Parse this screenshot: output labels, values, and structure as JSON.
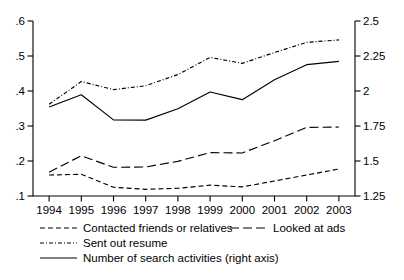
{
  "chart_data": {
    "type": "line",
    "title": "",
    "subtitle": "",
    "xlabel": "",
    "ylabel": "",
    "y2label": "",
    "grid": false,
    "legend_position": "bottom",
    "x": [
      1994,
      1995,
      1996,
      1997,
      1998,
      1999,
      2000,
      2001,
      2002,
      2003
    ],
    "xtick_labels": [
      "1994",
      "1995",
      "1996",
      "1997",
      "1998",
      "1999",
      "2000",
      "2001",
      "2002",
      "2003"
    ],
    "ylim": [
      0.1,
      0.6
    ],
    "ytick_values": [
      0.1,
      0.2,
      0.3,
      0.4,
      0.5,
      0.6
    ],
    "ytick_labels": [
      ".1",
      ".2",
      ".3",
      ".4",
      ".5",
      ".6"
    ],
    "y2lim": [
      1.25,
      2.5
    ],
    "y2tick_values": [
      1.25,
      1.5,
      1.75,
      2.0,
      2.25,
      2.5
    ],
    "y2tick_labels": [
      "1.25",
      "1.5",
      "1.75",
      "2",
      "2.25",
      "2.5"
    ],
    "series": [
      {
        "name": "Contacted friends or relatives",
        "axis": "left",
        "style": "dashed-short",
        "values": [
          0.16,
          0.162,
          0.125,
          0.119,
          0.122,
          0.131,
          0.126,
          0.143,
          0.16,
          0.177
        ]
      },
      {
        "name": "Looked at ads",
        "axis": "left",
        "style": "dashed-long",
        "values": [
          0.168,
          0.215,
          0.182,
          0.183,
          0.199,
          0.224,
          0.223,
          0.258,
          0.296,
          0.297
        ]
      },
      {
        "name": "Sent out resume",
        "axis": "left",
        "style": "dash-dot",
        "values": [
          0.362,
          0.427,
          0.404,
          0.415,
          0.447,
          0.496,
          0.479,
          0.51,
          0.539,
          0.546
        ]
      },
      {
        "name": "Number of search activities (right axis)",
        "axis": "right",
        "style": "solid",
        "values": [
          1.886,
          1.973,
          1.794,
          1.792,
          1.873,
          1.993,
          1.938,
          2.081,
          2.188,
          2.212
        ],
        "values_left_scale": [
          0.355,
          0.389,
          0.317,
          0.317,
          0.349,
          0.407,
          0.385,
          0.442,
          0.485,
          0.495
        ]
      }
    ],
    "legend": [
      {
        "label": "Contacted friends or relatives",
        "style": "dashed-short"
      },
      {
        "label": "Looked at ads",
        "style": "dashed-long"
      },
      {
        "label": "Sent out resume",
        "style": "dash-dot"
      },
      {
        "label": "Number of search activities (right axis)",
        "style": "solid"
      }
    ]
  },
  "colors": {
    "ink": "#000000",
    "background": "#ffffff"
  }
}
